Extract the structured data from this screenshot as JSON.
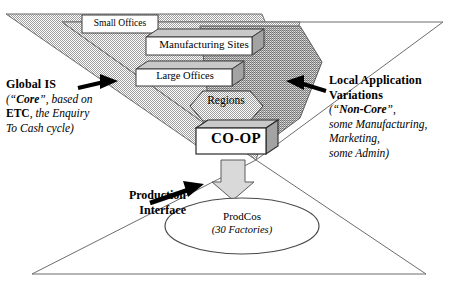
{
  "diagram": {
    "title": "",
    "nodes": {
      "small_offices": "Small Offices",
      "manufacturing_sites": "Manufacturing Sites",
      "large_offices": "Large Offices",
      "regions": "Regions",
      "coop": "CO-OP",
      "prodcos_name": "ProdCos",
      "prodcos_sub": "(30 Factories)"
    },
    "left_caption": {
      "heading": "Global IS",
      "line1_a": "(“",
      "line1_b": "Core",
      "line1_c": "”, based on",
      "line2_a": "ETC",
      "line2_b": ", the Enquiry",
      "line3": "To Cash cycle)"
    },
    "right_caption": {
      "heading_line1": "Local Application",
      "heading_line2": "Variations",
      "line1_a": "(“",
      "line1_b": "Non-Core",
      "line1_c": "”,",
      "line2": "some Manufacturing,",
      "line3": "Marketing,",
      "line4": "some Admin)"
    },
    "production_caption": {
      "line1": "Production",
      "line2": "Interface"
    },
    "colors": {
      "outer_funnel_fill": "#d9d9d9",
      "inner_funnel_fill": "#bdbdbd",
      "box_fill": "#ffffff",
      "box_top_fill": "#cfcfcf",
      "box_side_fill": "#a8a8a8",
      "arrow_fill": "#d6d6d6",
      "stroke": "#4a4a4a",
      "text": "#000000"
    }
  }
}
